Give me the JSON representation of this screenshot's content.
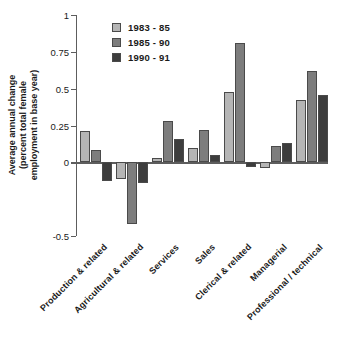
{
  "chart_data": {
    "type": "bar",
    "title": "",
    "subtitle": "",
    "xlabel": "",
    "ylabel": "Average annual change (percent total female employment in base year)",
    "ylabel_lines": [
      "Average annual change",
      "(percent total female",
      "employment in base year)"
    ],
    "ylim": [
      -0.5,
      1
    ],
    "yticks": [
      1,
      0.75,
      0.5,
      0.25,
      0,
      -0.5
    ],
    "ytick_labels": [
      "1",
      "0.75",
      "0.5",
      "0.25",
      "0",
      "-0.5"
    ],
    "grid": false,
    "legend_position": "upper-left-inside",
    "categories": [
      "Production & related",
      "Agricultural & related",
      "Services",
      "Sales",
      "Clerical & related",
      "Managerial",
      "Professional / technical"
    ],
    "series": [
      {
        "name": "1983 - 85",
        "color": "#b5b5b5",
        "values": [
          0.21,
          -0.11,
          0.03,
          0.1,
          0.48,
          -0.04,
          0.42
        ]
      },
      {
        "name": "1985 - 90",
        "color": "#7d7d7d",
        "values": [
          0.085,
          -0.42,
          0.28,
          0.22,
          0.81,
          0.11,
          0.62
        ]
      },
      {
        "name": "1990 - 91",
        "color": "#3d3d3d",
        "values": [
          -0.13,
          -0.14,
          0.16,
          0.05,
          -0.03,
          0.13,
          0.46
        ]
      }
    ]
  },
  "legend": {
    "items": [
      {
        "label": "1983 - 85",
        "color": "#b5b5b5"
      },
      {
        "label": "1985 - 90",
        "color": "#7d7d7d"
      },
      {
        "label": "1990 - 91",
        "color": "#3d3d3d"
      }
    ]
  },
  "axis": {
    "line_color": "#5d5d5d",
    "bar_edge_color": "#4a4a4a"
  }
}
